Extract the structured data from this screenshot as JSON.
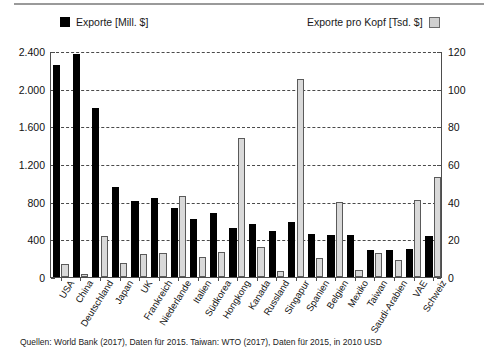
{
  "chart_data": {
    "type": "bar",
    "title": "",
    "subtitle": "",
    "xlabel": "",
    "ylabel": "",
    "grid": true,
    "legend_position": "top",
    "categories": [
      "USA",
      "China",
      "Deutschland",
      "Japan",
      "UK",
      "Frankreich",
      "Niederlande",
      "Italien",
      "Südkorea",
      "Hongkong",
      "Kanada",
      "Russland",
      "Singapur",
      "Spanien",
      "Belgien",
      "Mexiko",
      "Taiwan",
      "Saudi-Arabien",
      "VAE",
      "Schweiz"
    ],
    "series": [
      {
        "name": "Exporte [Mill. $]",
        "axis": "left",
        "color": "#000000",
        "values": [
          2250,
          2370,
          1790,
          960,
          810,
          840,
          730,
          620,
          680,
          525,
          560,
          490,
          580,
          460,
          450,
          450,
          285,
          290,
          300,
          440
        ]
      },
      {
        "name": "Exporte pro Kopf [Tsd. $]",
        "axis": "right",
        "color": "#d9d9d9",
        "values": [
          7,
          1.5,
          22,
          7.5,
          12,
          13,
          43,
          10.5,
          13.5,
          74,
          16,
          3,
          105,
          10,
          40,
          3.5,
          13,
          9,
          41,
          53
        ]
      }
    ],
    "left_axis": {
      "label": "Exporte [Mill. $]",
      "ticks": [
        "0",
        "400",
        "800",
        "1.200",
        "1.600",
        "2.000",
        "2.400"
      ],
      "tick_values": [
        0,
        400,
        800,
        1200,
        1600,
        2000,
        2400
      ],
      "ylim": [
        0,
        2400
      ]
    },
    "right_axis": {
      "label": "Exporte pro Kopf [Tsd. $]",
      "ticks": [
        "0",
        "20",
        "40",
        "60",
        "80",
        "100",
        "120"
      ],
      "tick_values": [
        0,
        20,
        40,
        60,
        80,
        100,
        120
      ],
      "ylim": [
        0,
        120
      ]
    },
    "annotations": [
      "Quellen: World Bank (2017), Daten für 2015. Taiwan: WTO (2017), Daten für 2015, in 2010 USD"
    ]
  },
  "legend": {
    "left": {
      "label": "Exporte [Mill. $]",
      "swatch": "black-square"
    },
    "right": {
      "label": "Exporte pro Kopf [Tsd. $]",
      "swatch": "gray-square"
    }
  },
  "source_note": "Quellen: World Bank (2017), Daten für 2015. Taiwan: WTO (2017), Daten für 2015, in 2010 USD"
}
